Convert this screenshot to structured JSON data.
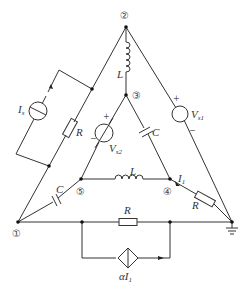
{
  "diagram": {
    "title": "",
    "type": "circuit-schematic",
    "nodes": [
      {
        "id": "n1",
        "label": "①"
      },
      {
        "id": "n2",
        "label": "②"
      },
      {
        "id": "n3",
        "label": "③"
      },
      {
        "id": "n4",
        "label": "④"
      },
      {
        "id": "n5",
        "label": "⑤"
      },
      {
        "id": "gnd",
        "label": ""
      }
    ],
    "labels": {
      "L_top": "L",
      "L_mid": "L",
      "C_inner": "C",
      "C_left": "C",
      "R_left": "R",
      "R_right": "R",
      "R_bottom": "R",
      "Is": "I",
      "Is_sub": "s",
      "Vs1": "V",
      "Vs1_sub": "s1",
      "Vs2": "V",
      "Vs2_sub": "s2",
      "I1": "I",
      "I1_sub": "1",
      "cccs": "αI",
      "cccs_sub": "1",
      "plus": "+",
      "minus": "−"
    },
    "components": [
      {
        "name": "inductor",
        "label": "L",
        "from": "②",
        "to": "③"
      },
      {
        "name": "voltage-source",
        "label": "Vs1",
        "from": "②",
        "to": "ground"
      },
      {
        "name": "voltage-source",
        "label": "Vs2",
        "from": "③",
        "to": "⑤"
      },
      {
        "name": "capacitor",
        "label": "C",
        "from": "③",
        "to": "④"
      },
      {
        "name": "inductor",
        "label": "L",
        "from": "⑤",
        "to": "④"
      },
      {
        "name": "resistor",
        "label": "R",
        "from": "④",
        "to": "ground",
        "current": "I1"
      },
      {
        "name": "capacitor",
        "label": "C",
        "from": "①",
        "to": "⑤"
      },
      {
        "name": "resistor",
        "label": "R",
        "from": "①",
        "to": "ground"
      },
      {
        "name": "cccs",
        "label": "αI1",
        "parallel_to": "bottom R"
      },
      {
        "name": "current-source",
        "label": "Is",
        "parallel_to": "left R"
      },
      {
        "name": "resistor",
        "label": "R",
        "from": "②",
        "to": "①"
      }
    ]
  }
}
